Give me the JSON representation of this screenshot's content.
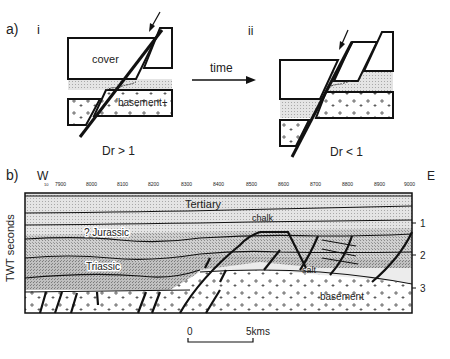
{
  "panel_a": {
    "label": "a)",
    "sub_i": "i",
    "sub_ii": "ii",
    "cover_label": "cover",
    "basement_label": "'basement+",
    "arrow_label": "time",
    "caption_i": "Dr > 1",
    "caption_ii": "Dr < 1"
  },
  "panel_b": {
    "label": "b)",
    "west": "W",
    "east": "E",
    "x_ticks": [
      "7900",
      "8000",
      "8100",
      "8200",
      "8300",
      "8400",
      "8500",
      "8600",
      "8700",
      "8800",
      "8900",
      "9000"
    ],
    "y_axis_label": "TWT seconds",
    "y_ticks": [
      "1",
      "2",
      "3"
    ],
    "units": {
      "tertiary": "Tertiary",
      "chalk": "chalk",
      "jurassic": "? Jurassic",
      "triassic": "Triassic",
      "salt": "salt",
      "basement": "basement"
    },
    "scale_bar": {
      "start": "0",
      "end": "5kms"
    }
  },
  "colors": {
    "line": "#111111",
    "tertiary_fill": "#dcdcdc",
    "mid_fill": "#c4c4c4",
    "lower_fill": "#b4b4b4",
    "salt_fill": "#ececec",
    "basement_fill": "#ffffff"
  }
}
